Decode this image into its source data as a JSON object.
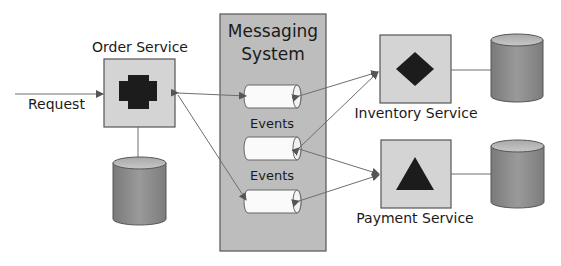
{
  "diagram": {
    "request": {
      "label": "Request"
    },
    "order_service": {
      "label": "Order Service",
      "icon": "plus-cross-icon"
    },
    "messaging_system": {
      "label_line1": "Messaging",
      "label_line2": "System",
      "channels": [
        {
          "name": "channel-1"
        },
        {
          "label": "Events"
        },
        {
          "name": "channel-2"
        },
        {
          "label": "Events"
        },
        {
          "name": "channel-3"
        }
      ],
      "event_labels": [
        "Events",
        "Events"
      ]
    },
    "inventory_service": {
      "label": "Inventory Service",
      "icon": "diamond-icon"
    },
    "payment_service": {
      "label": "Payment Service",
      "icon": "triangle-icon"
    },
    "databases": [
      "order-database",
      "inventory-database",
      "payment-database"
    ],
    "colors": {
      "service_fill": "#d4d4d4",
      "messaging_fill": "#bdbdbd",
      "border": "#5a5a5a",
      "icon_fill": "#1c1c1c",
      "pipe_fill": "#fafafa",
      "db_fill": "#8c8c8c",
      "db_top": "#b8b8b8",
      "line": "#6e6e6e"
    }
  }
}
